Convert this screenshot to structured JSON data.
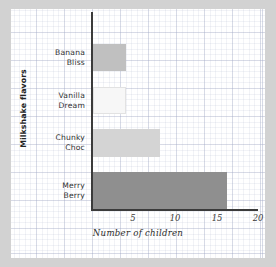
{
  "figure": {
    "background_color": "#ffffff",
    "page_color": "#d2d2d2",
    "grid": "graph-paper"
  },
  "axes": {
    "x_title": "Number of children",
    "y_title": "Milkshake flavors",
    "x_ticks": [
      "5",
      "10",
      "15",
      "20"
    ],
    "axis_color": "#3b3b3b"
  },
  "chart_data": {
    "type": "bar",
    "orientation": "horizontal",
    "title": "",
    "xlabel": "Number of children",
    "ylabel": "Milkshake flavors",
    "categories": [
      "Banana Bliss",
      "Vanilla Dream",
      "Chunky Choc",
      "Merry Berry"
    ],
    "values": [
      4,
      4,
      8,
      16
    ],
    "bar_colors": [
      "#c0c0c0",
      "#f7f7f7",
      "#d4d4d4",
      "#8f8f8f"
    ],
    "bar_edge_colors": [
      "#c0c0c0",
      "#e2e2e2",
      "#d4d4d4",
      "#8f8f8f"
    ],
    "xlim": [
      0,
      20
    ],
    "xticks": [
      5,
      10,
      15,
      20
    ],
    "grid": true,
    "legend": "none",
    "series": [
      {
        "name": "Number of children",
        "values": [
          4,
          4,
          8,
          16
        ]
      }
    ],
    "labels": {
      "banana": "Banana\nBliss",
      "vanilla": "Vanilla\nDream",
      "chunky": "Chunky\nChoc",
      "merry": "Merry\nBerry"
    }
  }
}
